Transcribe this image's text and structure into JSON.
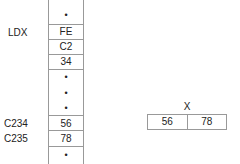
{
  "memory_top": {
    "label": "LDX",
    "cells": [
      {
        "type": "dot",
        "value": "•"
      },
      {
        "type": "value",
        "value": "FE"
      },
      {
        "type": "value",
        "value": "C2"
      },
      {
        "type": "value",
        "value": "34"
      },
      {
        "type": "dot",
        "value": "•"
      }
    ]
  },
  "memory_bottom": {
    "cells": [
      {
        "type": "dot",
        "value": "•"
      },
      {
        "type": "dot",
        "value": "•"
      },
      {
        "type": "value",
        "address": "C234",
        "value": "56"
      },
      {
        "type": "value",
        "address": "C235",
        "value": "78"
      },
      {
        "type": "dot",
        "value": "•"
      }
    ]
  },
  "register": {
    "name": "X",
    "high": "56",
    "low": "78"
  }
}
